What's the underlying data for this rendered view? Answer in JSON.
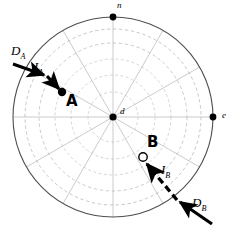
{
  "figure": {
    "type": "polar-diagram",
    "background": "#ffffff",
    "width": 241,
    "height": 232
  },
  "colors": {
    "outer_circle": "#5a5a5a",
    "grid": "#b9b9b9",
    "grid_inner": "#cfcfcf",
    "ink": "#000000",
    "point_fill": "#000000",
    "point_hollow_fill": "#ffffff"
  },
  "geometry": {
    "center": {
      "x": 113,
      "y": 117
    },
    "outer_radius": 100,
    "ring_radii": [
      25,
      42,
      58,
      74,
      88,
      100
    ],
    "spoke_count": 12,
    "spoke_step_degrees": 30
  },
  "axis_markers": [
    {
      "id": "north",
      "label": "n",
      "x": 113,
      "y": 17,
      "label_x": 117,
      "label_y": 3,
      "marker": "filled-dot"
    },
    {
      "id": "east",
      "label": "e",
      "x": 213,
      "y": 117,
      "label_x": 222,
      "label_y": 112,
      "marker": "filled-dot"
    },
    {
      "id": "center",
      "label": "d",
      "x": 113,
      "y": 117,
      "label_x": 120,
      "label_y": 108,
      "marker": "filled-dot"
    }
  ],
  "points": [
    {
      "id": "A",
      "label": "A",
      "marker": "filled-dot",
      "x": 62,
      "y": 92,
      "radius_px": 4.2,
      "label_x": 66,
      "label_y": 95
    },
    {
      "id": "B",
      "label": "B",
      "marker": "hollow-circle",
      "x": 143,
      "y": 157,
      "radius_px": 4.2,
      "label_x": 147,
      "label_y": 136
    }
  ],
  "rays": [
    {
      "id": "ray-A",
      "incoming_label": "D",
      "incoming_sub": "A",
      "incoming_label_x": 12,
      "incoming_label_y": 47,
      "internal_label": "I",
      "internal_sub": "A",
      "internal_label_x": 34,
      "internal_label_y": 63,
      "outer_arrow": {
        "x1": 13,
        "y1": 64,
        "x2": 47,
        "y2": 76
      },
      "inner_arrow": {
        "x1": 47,
        "y1": 76,
        "x2": 62,
        "y2": 92
      },
      "style": "solid"
    },
    {
      "id": "ray-B",
      "incoming_label": "D",
      "incoming_sub": "B",
      "incoming_label_x": 192,
      "incoming_label_y": 198,
      "internal_label": "I",
      "internal_sub": "B",
      "internal_label_x": 163,
      "internal_label_y": 166,
      "outer_arrow": {
        "x1": 210,
        "y1": 222,
        "x2": 177,
        "y2": 200
      },
      "inner_arrow": {
        "x1": 177,
        "y1": 200,
        "x2": 143,
        "y2": 160
      },
      "style": "dashed"
    }
  ]
}
